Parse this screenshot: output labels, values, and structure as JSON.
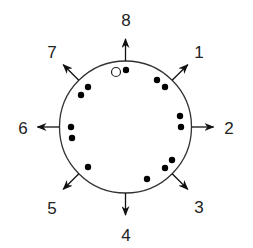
{
  "diagram": {
    "type": "circular-direction-diagram",
    "center": [
      125.5,
      127
    ],
    "radius": 66,
    "stroke_color": "#333333",
    "dot_color": "#000000",
    "directions": [
      {
        "label": "1",
        "angle_deg": 45,
        "label_pos": [
          199,
          58
        ]
      },
      {
        "label": "2",
        "angle_deg": 0,
        "label_pos": [
          229,
          134
        ]
      },
      {
        "label": "3",
        "angle_deg": -45,
        "label_pos": [
          199,
          213
        ]
      },
      {
        "label": "4",
        "angle_deg": -90,
        "label_pos": [
          126,
          241
        ]
      },
      {
        "label": "5",
        "angle_deg": -135,
        "label_pos": [
          52,
          214
        ]
      },
      {
        "label": "6",
        "angle_deg": 180,
        "label_pos": [
          23,
          134
        ]
      },
      {
        "label": "7",
        "angle_deg": 135,
        "label_pos": [
          52,
          58
        ]
      },
      {
        "label": "8",
        "angle_deg": 90,
        "label_pos": [
          126,
          26
        ]
      }
    ],
    "filled_dots": [
      [
        126,
        70
      ],
      [
        157,
        80
      ],
      [
        165,
        87
      ],
      [
        180,
        116
      ],
      [
        181,
        127
      ],
      [
        172,
        160
      ],
      [
        165,
        168
      ],
      [
        147,
        179
      ],
      [
        88,
        167
      ],
      [
        71,
        127
      ],
      [
        72,
        138
      ],
      [
        88,
        87
      ],
      [
        81,
        95
      ]
    ],
    "open_dots": [
      [
        116,
        72
      ]
    ]
  }
}
